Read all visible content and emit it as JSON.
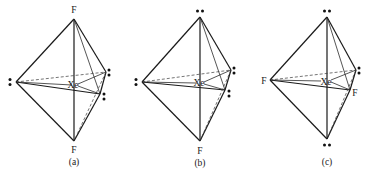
{
  "figure": {
    "central_atom": "Xe",
    "panels": [
      {
        "id": "a",
        "caption": "(a)",
        "axial_top": "F",
        "axial_bottom": "F",
        "equatorial": [
          "lone-pair",
          "lone-pair",
          "lone-pair"
        ],
        "labels": {
          "top": "F",
          "bottom": "F",
          "center": "Xe"
        }
      },
      {
        "id": "b",
        "caption": "(b)",
        "axial_top": "lone-pair",
        "axial_bottom": "F",
        "equatorial": [
          "lone-pair",
          "lone-pair",
          "lone-pair"
        ],
        "labels": {
          "bottom": "F",
          "center": "Xe"
        }
      },
      {
        "id": "c",
        "caption": "(c)",
        "axial_top": "lone-pair",
        "axial_bottom": "lone-pair",
        "equatorial": [
          "F",
          "lone-pair",
          "F"
        ],
        "labels": {
          "left": "F",
          "right_front": "F",
          "center": "Xe"
        }
      }
    ]
  }
}
